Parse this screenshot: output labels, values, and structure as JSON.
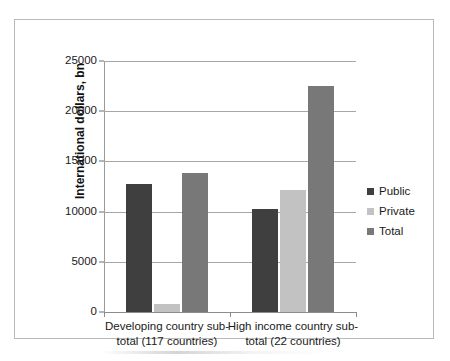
{
  "chart_data": {
    "type": "bar",
    "title": "",
    "xlabel": "",
    "ylabel": "International dollars, bn",
    "ylim": [
      0,
      25000
    ],
    "ytick_values": [
      25000,
      20000,
      15000,
      10000,
      5000,
      0
    ],
    "ytick_labels": [
      "25000",
      "20000",
      "15000",
      "10000",
      "5000",
      "0"
    ],
    "grid": true,
    "legend_position": "right",
    "categories": [
      "Developing country sub-total (117 countries)",
      "High income country sub-total (22 countries)"
    ],
    "category_lines": [
      [
        "Developing country sub-",
        "total (117 countries)"
      ],
      [
        "High income country sub-",
        "total (22 countries)"
      ]
    ],
    "series": [
      {
        "name": "Public",
        "color": "#3f3f3f",
        "values": [
          12800,
          10300
        ]
      },
      {
        "name": "Private",
        "color": "#c2c2c2",
        "values": [
          800,
          12200
        ]
      },
      {
        "name": "Total",
        "color": "#787878",
        "values": [
          13800,
          22500
        ]
      }
    ]
  },
  "legend": {
    "items": [
      {
        "label": "Public",
        "color": "#3f3f3f"
      },
      {
        "label": "Private",
        "color": "#c2c2c2"
      },
      {
        "label": "Total",
        "color": "#787878"
      }
    ]
  },
  "axis": {
    "y_title": "International dollars, bn"
  }
}
